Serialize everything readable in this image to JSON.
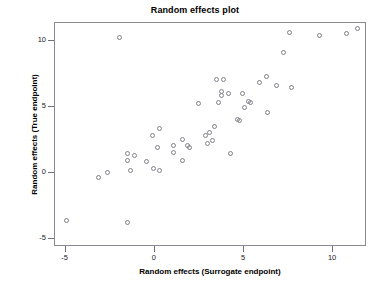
{
  "chart_data": {
    "type": "scatter",
    "title": "Random effects plot",
    "xlabel": "Random effects (Surrogate endpoint)",
    "ylabel": "Random effects (True endpoint)",
    "xlim": [
      -5.6,
      11.9
    ],
    "ylim": [
      -5.6,
      11.4
    ],
    "xticks": [
      -5,
      0,
      5,
      10
    ],
    "yticks": [
      -5,
      0,
      5,
      10
    ],
    "xtick_labels": [
      "-5",
      "0",
      "5",
      "10"
    ],
    "ytick_labels": [
      "-5",
      "0",
      "5",
      "10"
    ],
    "grid": false,
    "legend": null,
    "marker": "open-circle",
    "marker_color": "#808089",
    "frame_color": "#8a8a94",
    "background": "#ffffff",
    "points": [
      {
        "x": -4.9,
        "y": -3.7
      },
      {
        "x": -3.1,
        "y": -0.4
      },
      {
        "x": -2.6,
        "y": 0.0
      },
      {
        "x": -1.5,
        "y": 1.4
      },
      {
        "x": -1.5,
        "y": 0.9
      },
      {
        "x": -1.5,
        "y": -3.8
      },
      {
        "x": -1.1,
        "y": 1.3
      },
      {
        "x": -1.3,
        "y": 0.1
      },
      {
        "x": -0.4,
        "y": 0.8
      },
      {
        "x": -0.1,
        "y": 2.8
      },
      {
        "x": 0.0,
        "y": 0.3
      },
      {
        "x": 0.2,
        "y": 1.9
      },
      {
        "x": 0.3,
        "y": 3.3
      },
      {
        "x": 0.3,
        "y": 0.1
      },
      {
        "x": 1.1,
        "y": 2.0
      },
      {
        "x": 1.1,
        "y": 1.5
      },
      {
        "x": 1.6,
        "y": 2.5
      },
      {
        "x": 1.6,
        "y": 0.9
      },
      {
        "x": 1.9,
        "y": 2.0
      },
      {
        "x": 2.0,
        "y": 1.9
      },
      {
        "x": 2.5,
        "y": 5.2
      },
      {
        "x": 2.9,
        "y": 2.8
      },
      {
        "x": 3.0,
        "y": 2.2
      },
      {
        "x": 3.1,
        "y": 3.0
      },
      {
        "x": 3.3,
        "y": 2.4
      },
      {
        "x": 3.4,
        "y": 3.5
      },
      {
        "x": 3.5,
        "y": 7.0
      },
      {
        "x": 3.6,
        "y": 5.3
      },
      {
        "x": 3.8,
        "y": 6.1
      },
      {
        "x": 3.8,
        "y": 5.8
      },
      {
        "x": 3.9,
        "y": 7.0
      },
      {
        "x": 4.2,
        "y": 6.0
      },
      {
        "x": 4.3,
        "y": 1.4
      },
      {
        "x": 4.7,
        "y": 4.0
      },
      {
        "x": 4.8,
        "y": 3.9
      },
      {
        "x": 5.0,
        "y": 6.0
      },
      {
        "x": 5.1,
        "y": 4.9
      },
      {
        "x": 5.3,
        "y": 5.4
      },
      {
        "x": 5.4,
        "y": 5.3
      },
      {
        "x": 5.9,
        "y": 6.8
      },
      {
        "x": 6.3,
        "y": 7.3
      },
      {
        "x": 6.4,
        "y": 4.5
      },
      {
        "x": 6.9,
        "y": 6.6
      },
      {
        "x": 7.3,
        "y": 9.1
      },
      {
        "x": 7.6,
        "y": 10.6
      },
      {
        "x": 7.7,
        "y": 6.4
      },
      {
        "x": 9.3,
        "y": 10.4
      },
      {
        "x": 10.8,
        "y": 10.5
      },
      {
        "x": 11.4,
        "y": 10.9
      },
      {
        "x": -1.9,
        "y": 10.2
      }
    ]
  }
}
